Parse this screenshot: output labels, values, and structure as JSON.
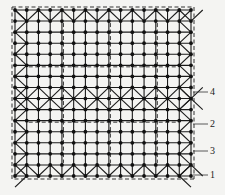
{
  "diagram": {
    "type": "grid-structure-plan",
    "grid": {
      "cols": 16,
      "rows": 16,
      "x0": 15,
      "x1": 191,
      "y0": 10,
      "y1": 176
    },
    "colors": {
      "line": "#1a1a1a",
      "node": "#111111",
      "dash": "#333333",
      "background": "#f4f4f2"
    },
    "callouts": [
      {
        "label": "4",
        "y": 92
      },
      {
        "label": "2",
        "y": 124
      },
      {
        "label": "3",
        "y": 151
      },
      {
        "label": "1",
        "y": 175
      }
    ]
  }
}
